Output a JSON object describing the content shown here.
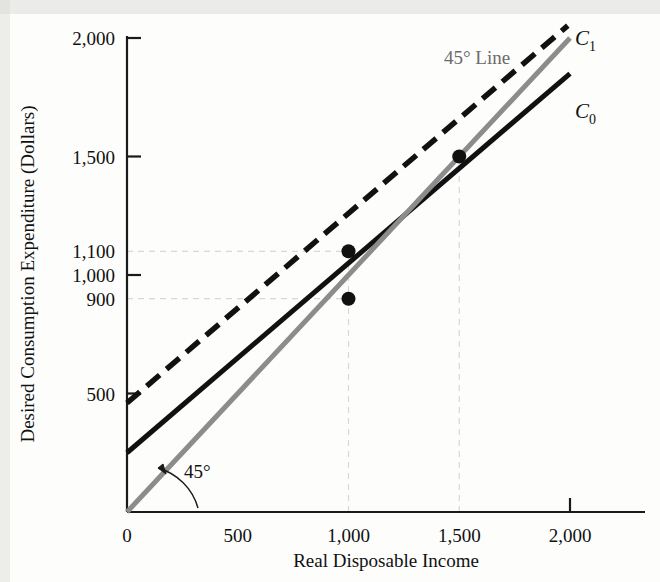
{
  "chart_data": {
    "type": "line",
    "title": "",
    "xlabel": "Real Disposable Income",
    "ylabel": "Desired Consumption Expenditure (Dollars)",
    "xlim": [
      0,
      2100
    ],
    "ylim": [
      0,
      2000
    ],
    "xticks": [
      "0",
      "500",
      "1,000",
      "1,500",
      "2,000"
    ],
    "xtick_values": [
      0,
      500,
      1000,
      1500,
      2000
    ],
    "yticks": [
      "500",
      "900",
      "1,000",
      "1,100",
      "1,500",
      "2,000"
    ],
    "ytick_values": [
      500,
      900,
      1000,
      1100,
      1500,
      2000
    ],
    "grid": "dashed-guides-only",
    "legend": "inline-end-labels",
    "series": [
      {
        "name": "C_0",
        "label_base": "C",
        "label_sub": "0",
        "style": "solid",
        "color": "#111111",
        "intercept": 250,
        "slope": 0.8,
        "x": [
          0,
          2000
        ],
        "y": [
          250,
          1850
        ]
      },
      {
        "name": "C_1",
        "label_base": "C",
        "label_sub": "1",
        "style": "dashed",
        "color": "#111111",
        "intercept": 460,
        "slope": 0.8,
        "x": [
          0,
          1990
        ],
        "y": [
          460,
          2052
        ]
      },
      {
        "name": "45-degree Line",
        "label_base": "45° Line",
        "label_sub": "",
        "style": "solid",
        "color": "#8c8c8c",
        "intercept": 0,
        "slope": 1,
        "x": [
          0,
          2000
        ],
        "y": [
          0,
          2000
        ]
      }
    ],
    "points": [
      {
        "name": "point-c1-at-1000",
        "x": 1000,
        "y": 1100,
        "series": "C_1"
      },
      {
        "name": "point-c0-at-1000",
        "x": 1000,
        "y": 900,
        "series": "C_0"
      },
      {
        "name": "point-c1-equilibrium",
        "x": 1500,
        "y": 1500,
        "series": "C_1"
      }
    ],
    "guides_horizontal": [
      {
        "value": 1100,
        "to_x": 1000
      },
      {
        "value": 900,
        "to_x": 1000
      }
    ],
    "guides_vertical": [
      {
        "value": 1000,
        "to_y": 1100
      },
      {
        "value": 1500,
        "to_y": 1500
      }
    ],
    "annotations": [
      {
        "name": "angle-annotation",
        "text": "45°",
        "x": 330,
        "y": 210
      },
      {
        "name": "forty-five-line-label",
        "text": "45° Line",
        "x": 1450,
        "y": 1930
      }
    ]
  },
  "colors": {
    "axis": "#1a1a1a",
    "series_dark": "#111111",
    "series_gray": "#8c8c8c",
    "guide": "#d6d6d6",
    "background": "#fdfdfc"
  }
}
